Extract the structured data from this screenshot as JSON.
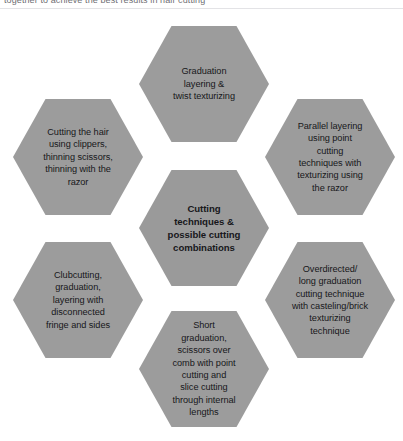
{
  "page": {
    "background_color": "#ffffff",
    "clipped_header_text": "together to achieve the best results in hair cutting",
    "hex_fill_color": "#9c9c9c",
    "hex_center_fill_color": "#9a9a9a",
    "hex_text_color": "#17171a"
  },
  "diagram": {
    "type": "hexagon-cluster",
    "center": {
      "id": "center",
      "label": "Cutting\ntechniques &\npossible cutting\ncombinations",
      "bold": true
    },
    "nodes": [
      {
        "id": "top",
        "position": "top",
        "label": "Graduation\nlayering &\ntwist texturizing"
      },
      {
        "id": "top-left",
        "position": "top-left",
        "label": "Cutting the hair\nusing clippers,\nthinning scissors,\nthinning with the\nrazor"
      },
      {
        "id": "top-right",
        "position": "top-right",
        "label": "Parallel layering\nusing point\ncutting\ntechniques with\ntexturizing using\nthe razor"
      },
      {
        "id": "bottom-left",
        "position": "bottom-left",
        "label": "Clubcutting,\ngraduation,\nlayering with\ndisconnected\nfringe and sides"
      },
      {
        "id": "bottom-right",
        "position": "bottom-right",
        "label": "Overdirected/\nlong graduation\ncutting technique\nwith casteling/brick\ntexturizing\ntechnique"
      },
      {
        "id": "bottom",
        "position": "bottom",
        "label": "Short\ngraduation,\nscissors over\ncomb with point\ncutting and\nslice cutting\nthrough internal\nlengths"
      }
    ]
  }
}
